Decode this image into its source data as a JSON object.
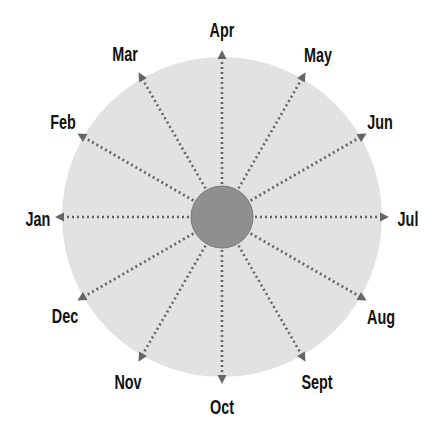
{
  "diagram": {
    "type": "radial-months",
    "center": {
      "x": 222,
      "y": 217
    },
    "outer_radius": 160,
    "inner_radius": 31,
    "arrow_radius": 165,
    "label_radius": 200,
    "colors": {
      "outer_fill": "#e2e2e2",
      "inner_fill": "#8f8f8f",
      "inner_stroke": "#7a7a7a",
      "spoke": "#666666",
      "label": "#111111"
    },
    "months": [
      {
        "label": "Jan",
        "angle": 180,
        "lx": 38,
        "ly": 219
      },
      {
        "label": "Feb",
        "angle": 150,
        "lx": 63,
        "ly": 122
      },
      {
        "label": "Mar",
        "angle": 120,
        "lx": 125,
        "ly": 54
      },
      {
        "label": "Apr",
        "angle": 90,
        "lx": 222,
        "ly": 30
      },
      {
        "label": "May",
        "angle": 60,
        "lx": 318,
        "ly": 55
      },
      {
        "label": "Jun",
        "angle": 30,
        "lx": 380,
        "ly": 122
      },
      {
        "label": "Jul",
        "angle": 0,
        "lx": 408,
        "ly": 219
      },
      {
        "label": "Aug",
        "angle": -30,
        "lx": 381,
        "ly": 317
      },
      {
        "label": "Sept",
        "angle": -60,
        "lx": 317,
        "ly": 382
      },
      {
        "label": "Oct",
        "angle": -90,
        "lx": 222,
        "ly": 407
      },
      {
        "label": "Nov",
        "angle": -120,
        "lx": 128,
        "ly": 382
      },
      {
        "label": "Dec",
        "angle": -150,
        "lx": 65,
        "ly": 316
      }
    ]
  }
}
